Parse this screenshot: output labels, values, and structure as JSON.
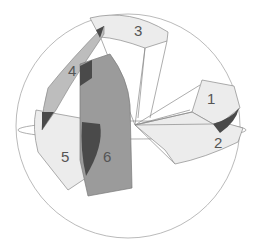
{
  "diagram": {
    "type": "spherical-regions",
    "sphere": {
      "cx": 128,
      "cy": 126,
      "r": 112
    },
    "colors": {
      "outline": "#9a9a9a",
      "light": "#ececec",
      "medium": "#bdbdbd",
      "dark_medium": "#9b9b9b",
      "dark": "#4a4a4a",
      "label": "#555555"
    },
    "regions": [
      {
        "id": "1",
        "label": "1",
        "shade": "light"
      },
      {
        "id": "2",
        "label": "2",
        "shade": "light"
      },
      {
        "id": "3",
        "label": "3",
        "shade": "light"
      },
      {
        "id": "4",
        "label": "4",
        "shade": "medium"
      },
      {
        "id": "5",
        "label": "5",
        "shade": "light"
      },
      {
        "id": "6",
        "label": "6",
        "shade": "dark_medium"
      }
    ]
  }
}
